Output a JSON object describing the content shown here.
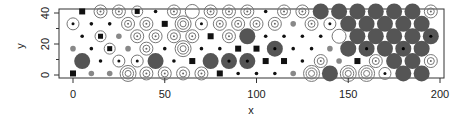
{
  "chart_data": {
    "type": "scatter",
    "title": "",
    "xlabel": "x",
    "ylabel": "y",
    "xlim": [
      -3,
      203
    ],
    "ylim": [
      -2,
      42
    ],
    "xticks": [
      0,
      50,
      100,
      150,
      200
    ],
    "yticks": [
      0,
      20,
      40
    ],
    "grid": false,
    "legend": "none",
    "marker_styles": {
      "F": "large filled grey circle",
      "R1": "single open ring",
      "R2": "double concentric rings",
      "R3": "triple concentric rings",
      "RD": "open ring with centre dot",
      "S": "filled black square",
      "SR": "square inside ring",
      "D": "small dot",
      "G": "small grey dot"
    },
    "rows": [
      {
        "y": 41,
        "x_start": 5,
        "dx": 10,
        "glyphs": [
          "S",
          "R2",
          "R2",
          "SR",
          "D",
          "R2",
          "R1",
          "R2",
          "R2",
          "R2",
          "D",
          "R2",
          "R2",
          "F",
          "F",
          "F",
          "F",
          "F",
          "F",
          "R2"
        ]
      },
      {
        "y": 33,
        "x_start": 0,
        "dx": 10,
        "glyphs": [
          "RD",
          "D",
          "D",
          "R2",
          "R2",
          "S",
          "R3",
          "RD",
          "R2",
          "R2",
          "R2",
          "R2",
          "G",
          "R2",
          "RD",
          "F",
          "F",
          "F",
          "F",
          "F"
        ]
      },
      {
        "y": 25,
        "x_start": 5,
        "dx": 10,
        "glyphs": [
          "D",
          "SR",
          "G",
          "R2",
          "R2",
          "R2",
          "R2",
          "S",
          "R2",
          "F",
          "D",
          "D",
          "D",
          "D",
          "R1",
          "F",
          "F",
          "F",
          "F",
          "FD"
        ]
      },
      {
        "y": 17,
        "x_start": 0,
        "dx": 10,
        "glyphs": [
          "G",
          "D",
          "SR",
          "G",
          "R2",
          "D",
          "R3",
          "D",
          "D",
          "S",
          "S",
          "FD",
          "D",
          "D",
          "G",
          "F",
          "FD",
          "F",
          "FD",
          "F"
        ]
      },
      {
        "y": 9,
        "x_start": 5,
        "dx": 10,
        "glyphs": [
          "F",
          "D",
          "RD",
          "RD",
          "F",
          "D",
          "S",
          "F",
          "FD",
          "FD",
          "S",
          "S",
          "D",
          "R2",
          "G",
          "S",
          "R2",
          "F",
          "F",
          "R2"
        ]
      },
      {
        "y": 1,
        "x_start": 0,
        "dx": 10,
        "glyphs": [
          "S",
          "G",
          "G",
          "R3",
          "R2",
          "R2",
          "R2",
          "R2",
          "S",
          "D",
          "D",
          "D",
          "G",
          "R3",
          "F",
          "R3",
          "R3",
          "RD",
          "F",
          "F"
        ]
      }
    ]
  },
  "axes": {
    "x_title": "x",
    "y_title": "y",
    "x_tick_labels": [
      "0",
      "50",
      "100",
      "150",
      "200"
    ],
    "y_tick_labels": [
      "0",
      "20",
      "40"
    ]
  },
  "colors": {
    "filled": "#555555",
    "ring": "#777777",
    "square": "#111111",
    "axis": "#333333"
  }
}
